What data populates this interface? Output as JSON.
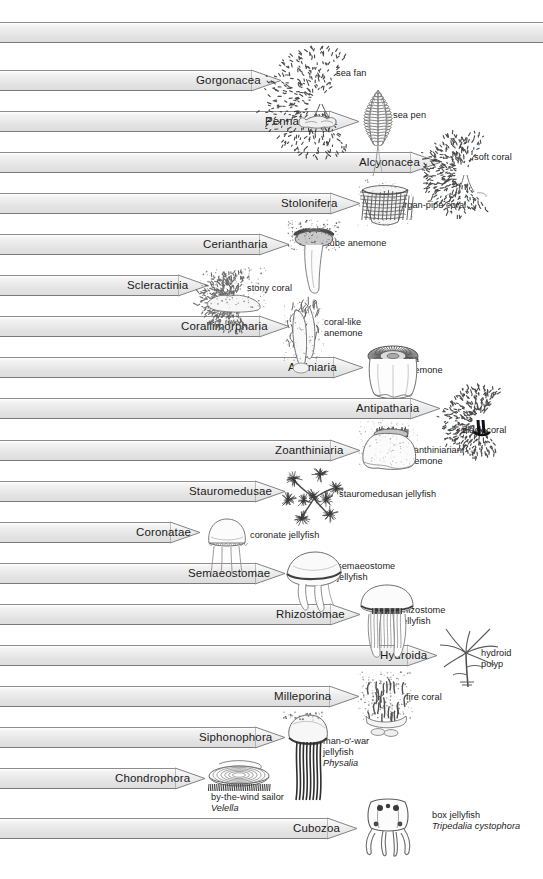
{
  "figure": {
    "background_color": "#ffffff",
    "bar_fill_top": "#ffffff",
    "bar_fill_bottom": "#dedede",
    "bar_stroke": "#8d8d8d",
    "text_color": "#1a1a1a"
  },
  "root_bar": {
    "label": ""
  },
  "taxa": [
    {
      "name": "Gorgonacea",
      "common": "sea fan",
      "italic": "",
      "label_x": 196,
      "bar_tip": 281,
      "bar_top": 70,
      "caption_x": 336,
      "caption_y": 68,
      "art": "sea-fan",
      "art_x": 281,
      "art_y": 42
    },
    {
      "name": "Pennatulacea",
      "common": "sea pen",
      "italic": "",
      "label_x": 265,
      "bar_tip": 359,
      "bar_top": 111,
      "caption_x": 393,
      "caption_y": 110,
      "art": "sea-pen",
      "art_x": 358,
      "art_y": 86
    },
    {
      "name": "Alcyonacea",
      "common": "soft coral",
      "italic": "",
      "label_x": 359,
      "bar_tip": 440,
      "bar_top": 152,
      "caption_x": 474,
      "caption_y": 152,
      "art": "soft-coral",
      "art_x": 440,
      "art_y": 127
    },
    {
      "name": "Stolonifera",
      "common": "organ-pipe coral",
      "italic": "",
      "label_x": 281,
      "bar_tip": 360,
      "bar_top": 193,
      "caption_x": 399,
      "caption_y": 200,
      "art": "organ-pipe-coral",
      "art_x": 358,
      "art_y": 180
    },
    {
      "name": "Ceriantharia",
      "common": "tube anemone",
      "italic": "",
      "label_x": 203,
      "bar_tip": 289,
      "bar_top": 234,
      "caption_x": 327,
      "caption_y": 238,
      "art": "tube-anemone",
      "art_x": 288,
      "art_y": 220
    },
    {
      "name": "Scleractinia",
      "common": "stony coral",
      "italic": "",
      "label_x": 127,
      "bar_tip": 208,
      "bar_top": 275,
      "caption_x": 247,
      "caption_y": 283,
      "art": "stony-coral",
      "art_x": 200,
      "art_y": 268
    },
    {
      "name": "Corallimorpharia",
      "common": "coral-like\nanemone",
      "italic": "",
      "label_x": 181,
      "bar_tip": 289,
      "bar_top": 316,
      "caption_x": 324,
      "caption_y": 317,
      "art": "coral-like-anemone",
      "art_x": 283,
      "art_y": 300
    },
    {
      "name": "Actiniaria",
      "common": "sea\nanemone",
      "italic": "",
      "label_x": 288,
      "bar_tip": 363,
      "bar_top": 357,
      "caption_x": 404,
      "caption_y": 354,
      "art": "sea-anemone",
      "art_x": 362,
      "art_y": 340
    },
    {
      "name": "Antipatharia",
      "common": "black coral",
      "italic": "",
      "label_x": 356,
      "bar_tip": 440,
      "bar_top": 398,
      "caption_x": 462,
      "caption_y": 425,
      "art": "black-coral",
      "art_x": 438,
      "art_y": 380
    },
    {
      "name": "Zoanthiniaria",
      "common": "zoanthiniarian\nanemone",
      "italic": "",
      "label_x": 275,
      "bar_tip": 360,
      "bar_top": 440,
      "caption_x": 404,
      "caption_y": 445,
      "art": "zoanthiniarian-anemone",
      "art_x": 358,
      "art_y": 420
    },
    {
      "name": "Stauromedusae",
      "common": "stauromedusan jellyfish",
      "italic": "",
      "label_x": 189,
      "bar_tip": 285,
      "bar_top": 481,
      "caption_x": 339,
      "caption_y": 489,
      "art": "stauromedusan-jellyfish",
      "art_x": 280,
      "art_y": 466
    },
    {
      "name": "Coronatae",
      "common": "coronate jellyfish",
      "italic": "",
      "label_x": 136,
      "bar_tip": 200,
      "bar_top": 522,
      "caption_x": 250,
      "caption_y": 530,
      "art": "coronate-jellyfish",
      "art_x": 199,
      "art_y": 513
    },
    {
      "name": "Semaeostomae",
      "common": "semaeostome\njellyfish",
      "italic": "",
      "label_x": 188,
      "bar_tip": 285,
      "bar_top": 563,
      "caption_x": 337,
      "caption_y": 561,
      "art": "semaeostome-jellyfish",
      "art_x": 283,
      "art_y": 548
    },
    {
      "name": "Rhizostomae",
      "common": "rhizostome\njellyfish",
      "italic": "",
      "label_x": 276,
      "bar_tip": 360,
      "bar_top": 604,
      "caption_x": 400,
      "caption_y": 605,
      "art": "rhizostome-jellyfish",
      "art_x": 357,
      "art_y": 582
    },
    {
      "name": "Hydroida",
      "common": "hydroid\npolyp",
      "italic": "",
      "label_x": 380,
      "bar_tip": 437,
      "bar_top": 645,
      "caption_x": 481,
      "caption_y": 648,
      "art": "hydroid-polyp",
      "art_x": 436,
      "art_y": 627
    },
    {
      "name": "Milleporina",
      "common": "fire coral",
      "italic": "",
      "label_x": 274,
      "bar_tip": 359,
      "bar_top": 686,
      "caption_x": 406,
      "caption_y": 692,
      "art": "fire-coral",
      "art_x": 358,
      "art_y": 672
    },
    {
      "name": "Siphonophora",
      "common": "man-o'-war\njellyfish",
      "italic": "Physalia",
      "label_x": 199,
      "bar_tip": 285,
      "bar_top": 727,
      "caption_x": 323,
      "caption_y": 736,
      "art": "man-o-war-jellyfish",
      "art_x": 283,
      "art_y": 712
    },
    {
      "name": "Chondrophora",
      "common": "by-the-wind sailor",
      "italic": "Velella",
      "label_x": 115,
      "bar_tip": 205,
      "bar_top": 768,
      "caption_x": 211,
      "caption_y": 792,
      "art": "by-the-wind-sailor",
      "art_x": 203,
      "art_y": 758
    },
    {
      "name": "Cubozoa",
      "common": "box jellyfish",
      "italic": "Tripedalia cystophora",
      "label_x": 293,
      "bar_tip": 357,
      "bar_top": 818,
      "caption_x": 432,
      "caption_y": 810,
      "art": "box-jellyfish",
      "art_x": 355,
      "art_y": 796
    }
  ]
}
